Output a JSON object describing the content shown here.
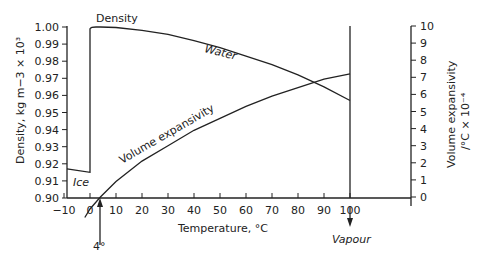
{
  "chart_data": {
    "type": "line",
    "title": "",
    "xlabel": "Temperature, °C",
    "ylabel": "Density, kg m−3 × 10³",
    "y2label_line1": "Volume expansivity",
    "y2label_line2": "/°C × 10⁻⁴",
    "xlim": [
      -10,
      100
    ],
    "ylim": [
      0.9,
      1.0
    ],
    "y2lim": [
      0,
      10
    ],
    "x_ticks": [
      "−10",
      "0",
      "10",
      "20",
      "30",
      "40",
      "50",
      "60",
      "70",
      "80",
      "90",
      "100"
    ],
    "y_ticks": [
      "1.00",
      "0.99",
      "0.98",
      "0.97",
      "0.96",
      "0.95",
      "0.94",
      "0.93",
      "0.92",
      "0.91",
      "0.90"
    ],
    "y2_ticks": [
      "10",
      "9",
      "8",
      "7",
      "6",
      "5",
      "4",
      "3",
      "2",
      "1",
      "0"
    ],
    "grid": false,
    "series": [
      {
        "name": "Ice density",
        "axis": "left",
        "x": [
          -10,
          0
        ],
        "values": [
          0.917,
          0.915
        ]
      },
      {
        "name": "Water density",
        "axis": "left",
        "x": [
          0,
          4,
          10,
          20,
          30,
          40,
          50,
          60,
          70,
          80,
          90,
          100
        ],
        "values": [
          0.9998,
          1.0,
          0.9997,
          0.998,
          0.9957,
          0.992,
          0.988,
          0.983,
          0.978,
          0.972,
          0.965,
          0.957
        ]
      },
      {
        "name": "Volume expansivity",
        "axis": "right",
        "x": [
          0,
          4,
          10,
          20,
          30,
          40,
          50,
          60,
          70,
          80,
          90,
          100
        ],
        "values": [
          -0.7,
          0,
          0.9,
          2.1,
          3.0,
          3.9,
          4.6,
          5.3,
          5.9,
          6.4,
          6.9,
          7.2
        ]
      }
    ],
    "annotations": {
      "density_label": "Density",
      "water_label": "Water",
      "ice_label": "Ice",
      "expansivity_label": "Volume expansivity",
      "four_degree_label": "4°",
      "vapour_label": "Vapour"
    }
  }
}
